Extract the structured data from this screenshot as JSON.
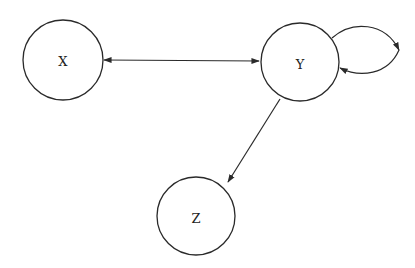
{
  "diagram": {
    "type": "directed-graph",
    "nodes": [
      {
        "id": "X",
        "label": "X",
        "cx": 63,
        "cy": 60,
        "r": 40
      },
      {
        "id": "Y",
        "label": "Y",
        "cx": 300,
        "cy": 62,
        "r": 39
      },
      {
        "id": "Z",
        "label": "Z",
        "cx": 196,
        "cy": 216,
        "r": 39
      }
    ],
    "edges": [
      {
        "from": "X",
        "to": "Y",
        "direction": "bidirectional"
      },
      {
        "from": "Y",
        "to": "Y",
        "direction": "self-loop"
      },
      {
        "from": "Y",
        "to": "Z",
        "direction": "forward"
      }
    ],
    "colors": {
      "stroke": "#2a2a2a",
      "background": "#ffffff",
      "text": "#222222"
    }
  }
}
